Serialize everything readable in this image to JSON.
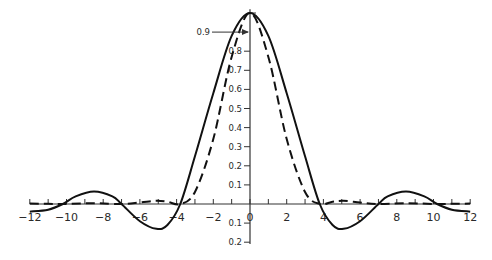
{
  "chart_data": {
    "type": "line",
    "title": "",
    "xlabel": "",
    "ylabel": "",
    "xlim": [
      -12,
      12
    ],
    "ylim": [
      -0.2,
      1.0
    ],
    "grid": false,
    "legend": null,
    "x_ticks": [
      -12,
      -10,
      -8,
      -6,
      -4,
      -2,
      0,
      2,
      4,
      6,
      8,
      10,
      12
    ],
    "x_tick_labels": [
      "-12",
      "-10",
      "-8",
      "-6",
      "-4",
      "-2",
      "0",
      "2",
      "4",
      "6",
      "8",
      "10",
      "12"
    ],
    "y_ticks_positive": [
      0.1,
      0.2,
      0.3,
      0.4,
      0.5,
      0.6,
      0.7,
      0.8
    ],
    "y_tick_labels_positive": [
      "0.1",
      "0.2",
      "0.3",
      "0.4",
      "0.5",
      "0.6",
      "0.7",
      "0.8"
    ],
    "y_ticks_negative": [
      -0.1,
      -0.2
    ],
    "y_tick_labels_negative": [
      "0.1",
      "0.2"
    ],
    "annotations": [
      {
        "text": "0.9",
        "x": 0,
        "y": 0.9,
        "arrow": true
      }
    ],
    "series": [
      {
        "name": "solid",
        "style": "solid",
        "description": "Sinc-like oscillating function, peak 1.0 at x=0, zeros near ±3.8, ±7.0, ±10.2, minimum about -0.13 near ±5.1, secondary maximum about 0.065 near ±8.4",
        "x": [
          -12,
          -11,
          -10.2,
          -9.5,
          -8.5,
          -7.5,
          -7.0,
          -6,
          -5.1,
          -4.5,
          -3.8,
          -3,
          -2,
          -1,
          0,
          1,
          2,
          3,
          3.8,
          4.5,
          5.1,
          6,
          7.0,
          7.5,
          8.5,
          9.5,
          10.2,
          11,
          12
        ],
        "y": [
          -0.04,
          -0.03,
          0.0,
          0.04,
          0.065,
          0.04,
          0.0,
          -0.09,
          -0.13,
          -0.11,
          0.0,
          0.25,
          0.58,
          0.88,
          1.0,
          0.88,
          0.58,
          0.25,
          0.0,
          -0.11,
          -0.13,
          -0.09,
          0.0,
          0.04,
          0.065,
          0.04,
          0.0,
          -0.03,
          -0.04
        ]
      },
      {
        "name": "dashed",
        "style": "dashed",
        "description": "Squared sinc-like function, narrower main lobe, peak 1.0 at x=0, zeros near ±3.8, ±7.0, ±10.2, small positive side lobes ~0.017",
        "x": [
          -12,
          -11,
          -10.2,
          -8.5,
          -7.0,
          -6,
          -5.1,
          -4.5,
          -3.8,
          -3,
          -2,
          -1,
          0,
          1,
          2,
          3,
          3.8,
          4.5,
          5.1,
          6,
          7.0,
          8.5,
          10.2,
          11,
          12
        ],
        "y": [
          0.002,
          0.001,
          0.0,
          0.004,
          0.0,
          0.008,
          0.017,
          0.012,
          0.0,
          0.063,
          0.34,
          0.77,
          1.0,
          0.77,
          0.34,
          0.063,
          0.0,
          0.012,
          0.017,
          0.008,
          0.0,
          0.004,
          0.0,
          0.001,
          0.002
        ]
      }
    ]
  },
  "style": {
    "line_color": "#111111",
    "axis_color": "#333333",
    "background": "#ffffff"
  }
}
